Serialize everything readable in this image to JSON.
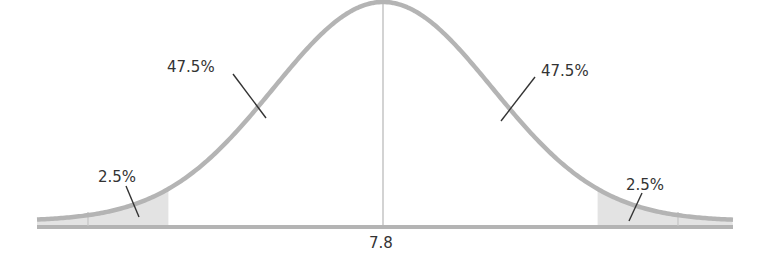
{
  "chart_data": {
    "type": "area",
    "title": "",
    "subtitle": "",
    "xlabel": "",
    "ylabel": "",
    "distribution": "normal",
    "mean": 7.8,
    "mean_label": "7.8",
    "tail_cutoff_z": 1.96,
    "regions": [
      {
        "name": "left-tail",
        "label": "2.5%",
        "value": 2.5,
        "shaded": true
      },
      {
        "name": "left-center",
        "label": "47.5%",
        "value": 47.5,
        "shaded": false
      },
      {
        "name": "right-center",
        "label": "47.5%",
        "value": 47.5,
        "shaded": false
      },
      {
        "name": "right-tail",
        "label": "2.5%",
        "value": 2.5,
        "shaded": true
      }
    ],
    "x_tick_labels": [
      "7.8"
    ],
    "grid": false,
    "legend": "none"
  },
  "labels": {
    "left_tail": "2.5%",
    "left_center": "47.5%",
    "right_center": "47.5%",
    "right_tail": "2.5%",
    "mean": "7.8"
  },
  "colors": {
    "curve": "#b4b4b4",
    "axis": "#b4b4b4",
    "tail_fill": "#e3e3e3",
    "center_line": "#bdbdbd",
    "leader": "#333333",
    "text": "#333333"
  },
  "layout": {
    "center_x": 383,
    "sigma_px": 109.5,
    "baseline_y": 221,
    "peak_y": 2,
    "x_start": 37,
    "x_end": 733
  }
}
